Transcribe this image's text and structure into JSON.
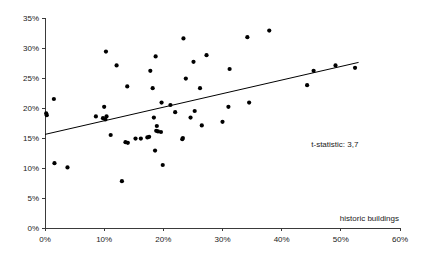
{
  "chart_data": {
    "type": "scatter",
    "title": "",
    "xlabel": "historic buildings",
    "ylabel": "",
    "xlim": [
      0,
      60
    ],
    "ylim": [
      0,
      35
    ],
    "grid": false,
    "legend": null,
    "x_ticks": [
      "0%",
      "10%",
      "20%",
      "30%",
      "40%",
      "50%",
      "60%"
    ],
    "x_tick_values": [
      0,
      10,
      20,
      30,
      40,
      50,
      60
    ],
    "y_ticks": [
      "0%",
      "5%",
      "10%",
      "15%",
      "20%",
      "25%",
      "30%",
      "35%"
    ],
    "y_tick_values": [
      0,
      5,
      10,
      15,
      20,
      25,
      30,
      35
    ],
    "annotations": [
      {
        "name": "t-statistic-annotation",
        "text": "t-statistic: 3,7",
        "x": 45.0,
        "y": 13.5
      }
    ],
    "trendline": {
      "name": "regression-line",
      "x_start": 0.0,
      "y_start": 15.6,
      "x_end": 53.0,
      "y_end": 27.6
    },
    "points": [
      {
        "x": 0.2,
        "y": 19.1
      },
      {
        "x": 0.3,
        "y": 18.8
      },
      {
        "x": 1.5,
        "y": 21.5
      },
      {
        "x": 1.6,
        "y": 10.8
      },
      {
        "x": 3.8,
        "y": 10.1
      },
      {
        "x": 8.6,
        "y": 18.6
      },
      {
        "x": 9.8,
        "y": 18.3
      },
      {
        "x": 10.0,
        "y": 20.2
      },
      {
        "x": 10.2,
        "y": 18.1
      },
      {
        "x": 10.3,
        "y": 29.4
      },
      {
        "x": 10.4,
        "y": 18.6
      },
      {
        "x": 11.1,
        "y": 15.5
      },
      {
        "x": 12.1,
        "y": 27.1
      },
      {
        "x": 13.0,
        "y": 7.8
      },
      {
        "x": 13.6,
        "y": 14.3
      },
      {
        "x": 13.9,
        "y": 23.6
      },
      {
        "x": 14.0,
        "y": 14.2
      },
      {
        "x": 15.3,
        "y": 14.9
      },
      {
        "x": 16.2,
        "y": 14.9
      },
      {
        "x": 17.3,
        "y": 15.1
      },
      {
        "x": 17.6,
        "y": 15.2
      },
      {
        "x": 17.8,
        "y": 26.2
      },
      {
        "x": 18.2,
        "y": 23.3
      },
      {
        "x": 18.4,
        "y": 18.4
      },
      {
        "x": 18.6,
        "y": 12.9
      },
      {
        "x": 18.7,
        "y": 28.6
      },
      {
        "x": 18.8,
        "y": 16.2
      },
      {
        "x": 18.9,
        "y": 17.0
      },
      {
        "x": 19.1,
        "y": 16.1
      },
      {
        "x": 19.6,
        "y": 16.0
      },
      {
        "x": 19.7,
        "y": 20.9
      },
      {
        "x": 19.9,
        "y": 10.5
      },
      {
        "x": 21.2,
        "y": 20.5
      },
      {
        "x": 22.0,
        "y": 19.3
      },
      {
        "x": 23.2,
        "y": 14.8
      },
      {
        "x": 23.3,
        "y": 15.0
      },
      {
        "x": 23.4,
        "y": 31.6
      },
      {
        "x": 23.8,
        "y": 24.9
      },
      {
        "x": 24.6,
        "y": 18.4
      },
      {
        "x": 25.1,
        "y": 27.7
      },
      {
        "x": 25.3,
        "y": 19.5
      },
      {
        "x": 26.2,
        "y": 23.3
      },
      {
        "x": 26.5,
        "y": 17.1
      },
      {
        "x": 27.3,
        "y": 28.8
      },
      {
        "x": 30.0,
        "y": 17.7
      },
      {
        "x": 31.0,
        "y": 20.2
      },
      {
        "x": 31.2,
        "y": 26.5
      },
      {
        "x": 34.2,
        "y": 31.8
      },
      {
        "x": 34.5,
        "y": 20.9
      },
      {
        "x": 37.9,
        "y": 32.9
      },
      {
        "x": 44.3,
        "y": 23.8
      },
      {
        "x": 45.4,
        "y": 26.2
      },
      {
        "x": 49.1,
        "y": 27.1
      },
      {
        "x": 52.4,
        "y": 26.7
      }
    ]
  },
  "style": {
    "point_color": "#000000",
    "line_color": "#000000",
    "axis_color": "#3a3a3a",
    "text_color": "#1a1a1a",
    "background": "#ffffff",
    "point_radius": 2.1
  }
}
